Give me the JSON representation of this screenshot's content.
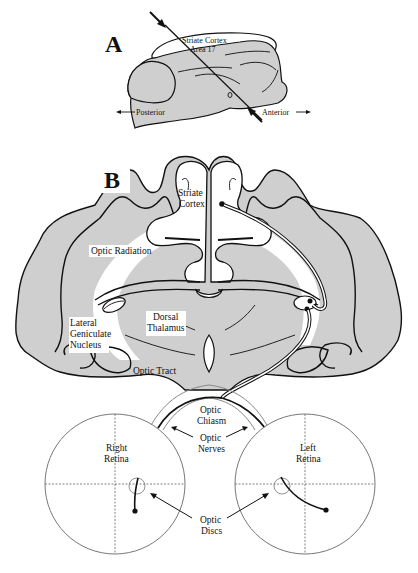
{
  "figure": {
    "panel_a": {
      "letter": "A",
      "cortex_label_line1": "Striate Cortex",
      "cortex_label_line2": "Area 17",
      "posterior": "Posterior",
      "anterior": "Anterior"
    },
    "panel_b": {
      "letter": "B",
      "labels": {
        "striate_line1": "Striate",
        "striate_line2": "Cortex",
        "optic_radiation": "Optic Radiation",
        "lgn_line1": "Lateral",
        "lgn_line2": "Geniculate",
        "lgn_line3": "Nucleus",
        "thalamus_line1": "Dorsal",
        "thalamus_line2": "Thalamus",
        "optic_tract": "Optic Tract",
        "chiasm_line1": "Optic",
        "chiasm_line2": "Chiasm",
        "nerves_line1": "Optic",
        "nerves_line2": "Nerves",
        "right_retina_line1": "Right",
        "right_retina_line2": "Retina",
        "left_retina_line1": "Left",
        "left_retina_line2": "Retina",
        "discs_line1": "Optic",
        "discs_line2": "Discs"
      }
    },
    "colors": {
      "gray_matter": "#cfcfcf",
      "outline": "#111111",
      "background": "#ffffff"
    }
  }
}
